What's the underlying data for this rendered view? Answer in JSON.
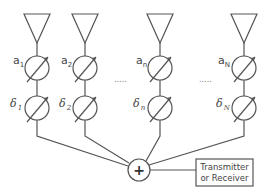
{
  "diagram": {
    "colors": {
      "stroke": "#555555",
      "text": "#444444",
      "background": "#ffffff"
    },
    "elements": [
      {
        "id": "1",
        "amplitude_label": "a",
        "amplitude_sub": "1",
        "phase_label": "δ",
        "phase_sub": "1"
      },
      {
        "id": "2",
        "amplitude_label": "a",
        "amplitude_sub": "2",
        "phase_label": "δ",
        "phase_sub": "2"
      },
      {
        "id": "n",
        "amplitude_label": "a",
        "amplitude_sub": "n",
        "phase_label": "δ",
        "phase_sub": "n"
      },
      {
        "id": "N",
        "amplitude_label": "a",
        "amplitude_sub": "N",
        "phase_label": "δ",
        "phase_sub": "N"
      }
    ],
    "ellipsis_left": ".....",
    "ellipsis_right": ".....",
    "summer_symbol": "+",
    "box_line1": "Transmitter",
    "box_line2": "or Receiver"
  }
}
